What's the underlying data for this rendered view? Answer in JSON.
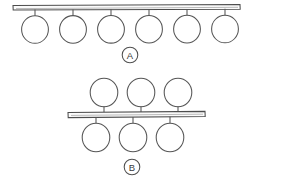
{
  "figure": {
    "background_color": "#ffffff",
    "ink_color": "#4f4f4f",
    "canvas": {
      "width": 294,
      "height": 177
    },
    "panels": [
      {
        "id": "A",
        "label": "A",
        "label_style": "circled-letter",
        "label_position": {
          "x": 130,
          "y": 55
        },
        "label_radius": 8,
        "description": "Single backbone bar with six identical circular pendant groups, all suspended below the bar by short vertical stems",
        "backbone": {
          "name": "backbone-bar-a",
          "x": 13,
          "y": 5,
          "width": 227,
          "height": 4.5,
          "skew_note": "slightly tilted hand-drawn bar"
        },
        "nodes_above": [],
        "nodes_below": [
          {
            "index": 1,
            "cx": 35,
            "cy": 29,
            "r": 13.5,
            "stem_x": 35,
            "stem_top": 9,
            "stem_bottom": 15.5
          },
          {
            "index": 2,
            "cx": 73,
            "cy": 29,
            "r": 13.5,
            "stem_x": 73,
            "stem_top": 9,
            "stem_bottom": 15.5
          },
          {
            "index": 3,
            "cx": 111,
            "cy": 29,
            "r": 13.5,
            "stem_x": 111,
            "stem_top": 9,
            "stem_bottom": 15.5
          },
          {
            "index": 4,
            "cx": 149,
            "cy": 29,
            "r": 13.5,
            "stem_x": 149,
            "stem_top": 9,
            "stem_bottom": 15.5
          },
          {
            "index": 5,
            "cx": 187,
            "cy": 29,
            "r": 13.5,
            "stem_x": 187,
            "stem_top": 9,
            "stem_bottom": 15.5
          },
          {
            "index": 6,
            "cx": 225,
            "cy": 29,
            "r": 13.5,
            "stem_x": 225,
            "stem_top": 9,
            "stem_bottom": 15.5
          }
        ],
        "counts": {
          "above": 0,
          "below": 6,
          "total": 6
        }
      },
      {
        "id": "B",
        "label": "B",
        "label_style": "circled-letter",
        "label_position": {
          "x": 132,
          "y": 167
        },
        "label_radius": 8,
        "description": "Single backbone bar with three circular pendant groups above and three below, laterally offset from each other",
        "backbone": {
          "name": "backbone-bar-b",
          "x": 68,
          "y": 111,
          "width": 137,
          "height": 5,
          "skew_note": "slightly tilted hand-drawn bar"
        },
        "nodes_above": [
          {
            "index": 1,
            "cx": 104,
            "cy": 93,
            "r": 14,
            "stem_x": 104,
            "stem_top": 107,
            "stem_bottom": 112
          },
          {
            "index": 2,
            "cx": 141,
            "cy": 93,
            "r": 14,
            "stem_x": 141,
            "stem_top": 107,
            "stem_bottom": 112
          },
          {
            "index": 3,
            "cx": 178,
            "cy": 93,
            "r": 14,
            "stem_x": 178,
            "stem_top": 107,
            "stem_bottom": 112
          }
        ],
        "nodes_below": [
          {
            "index": 1,
            "cx": 96,
            "cy": 137,
            "r": 14,
            "stem_x": 96,
            "stem_top": 116,
            "stem_bottom": 123
          },
          {
            "index": 2,
            "cx": 133,
            "cy": 137,
            "r": 14,
            "stem_x": 133,
            "stem_top": 116,
            "stem_bottom": 123
          },
          {
            "index": 3,
            "cx": 170,
            "cy": 137,
            "r": 14,
            "stem_x": 170,
            "stem_top": 116,
            "stem_bottom": 123
          }
        ],
        "counts": {
          "above": 3,
          "below": 3,
          "total": 6
        }
      }
    ]
  }
}
